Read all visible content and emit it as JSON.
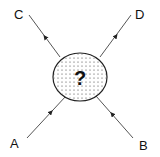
{
  "diagram": {
    "type": "scattering-process",
    "center_label": "?",
    "incoming": [
      {
        "label": "A",
        "position": "bottom-left"
      },
      {
        "label": "B",
        "position": "bottom-right"
      }
    ],
    "outgoing": [
      {
        "label": "C",
        "position": "top-left"
      },
      {
        "label": "D",
        "position": "top-right"
      }
    ],
    "colors": {
      "line": "#555555",
      "ink": "#111111",
      "fill": "#ffffff",
      "dots": "#333333"
    }
  }
}
